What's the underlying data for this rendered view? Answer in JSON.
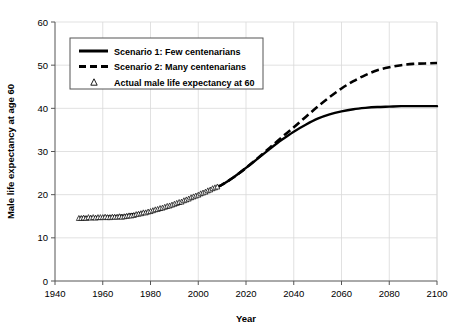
{
  "chart_data": {
    "type": "line",
    "title": "",
    "xlabel": "Year",
    "ylabel": "Male life expectancy at age 60",
    "xlim": [
      1940,
      2100
    ],
    "ylim": [
      0,
      60
    ],
    "xticks": [
      1940,
      1960,
      1980,
      2000,
      2020,
      2040,
      2060,
      2080,
      2100
    ],
    "yticks": [
      0,
      10,
      20,
      30,
      40,
      50,
      60
    ],
    "grid": true,
    "grid_color": "#d9d9d9",
    "legend_position": "upper-left",
    "series": [
      {
        "name": "Scenario 1: Few centenarians",
        "style": "solid",
        "color": "#000000",
        "x": [
          1950,
          1960,
          1970,
          1980,
          1990,
          2000,
          2008,
          2010,
          2015,
          2020,
          2025,
          2030,
          2035,
          2040,
          2045,
          2050,
          2055,
          2060,
          2065,
          2070,
          2075,
          2080,
          2085,
          2090,
          2095,
          2100
        ],
        "values": [
          14.6,
          14.8,
          15.2,
          16.1,
          17.6,
          19.8,
          21.8,
          22.3,
          24.1,
          26.2,
          28.4,
          30.6,
          32.7,
          34.6,
          36.2,
          37.6,
          38.6,
          39.3,
          39.8,
          40.1,
          40.3,
          40.4,
          40.5,
          40.5,
          40.5,
          40.5
        ]
      },
      {
        "name": "Scenario 2: Many centenarians",
        "style": "dashed",
        "color": "#000000",
        "x": [
          1950,
          1960,
          1970,
          1980,
          1990,
          2000,
          2008,
          2010,
          2015,
          2020,
          2025,
          2030,
          2035,
          2040,
          2045,
          2050,
          2055,
          2060,
          2065,
          2070,
          2075,
          2080,
          2085,
          2090,
          2095,
          2100
        ],
        "values": [
          14.6,
          14.8,
          15.2,
          16.1,
          17.6,
          19.8,
          21.8,
          22.3,
          24.1,
          26.2,
          28.5,
          30.9,
          33.3,
          35.6,
          38.0,
          40.4,
          42.6,
          44.6,
          46.3,
          47.7,
          48.8,
          49.5,
          50.0,
          50.3,
          50.4,
          50.5
        ]
      },
      {
        "name": "Actual male life expectancy at 60",
        "style": "markers",
        "marker": "triangle",
        "color": "#000000",
        "x": [
          1950,
          1951,
          1952,
          1953,
          1954,
          1955,
          1956,
          1957,
          1958,
          1959,
          1960,
          1961,
          1962,
          1963,
          1964,
          1965,
          1966,
          1967,
          1968,
          1969,
          1970,
          1971,
          1972,
          1973,
          1974,
          1975,
          1976,
          1977,
          1978,
          1979,
          1980,
          1981,
          1982,
          1983,
          1984,
          1985,
          1986,
          1987,
          1988,
          1989,
          1990,
          1991,
          1992,
          1993,
          1994,
          1995,
          1996,
          1997,
          1998,
          1999,
          2000,
          2001,
          2002,
          2003,
          2004,
          2005,
          2006,
          2007,
          2008
        ],
        "values": [
          14.6,
          14.6,
          14.7,
          14.6,
          14.8,
          14.7,
          14.8,
          14.7,
          14.8,
          14.8,
          14.8,
          14.9,
          14.8,
          14.8,
          14.9,
          14.9,
          14.9,
          15.0,
          14.9,
          15.0,
          15.1,
          15.2,
          15.2,
          15.3,
          15.5,
          15.6,
          15.7,
          15.9,
          15.9,
          16.1,
          16.2,
          16.4,
          16.6,
          16.7,
          16.9,
          17.0,
          17.2,
          17.4,
          17.5,
          17.7,
          17.9,
          18.1,
          18.3,
          18.4,
          18.7,
          18.9,
          19.1,
          19.4,
          19.6,
          19.8,
          20.0,
          20.3,
          20.5,
          20.7,
          21.0,
          21.2,
          21.5,
          21.7,
          21.9
        ]
      }
    ]
  },
  "legend": {
    "entries": [
      {
        "label": "Scenario 1: Few centenarians",
        "style": "solid"
      },
      {
        "label": "Scenario 2: Many centenarians",
        "style": "dashed"
      },
      {
        "label": "Actual male life expectancy at 60",
        "style": "triangle"
      }
    ]
  }
}
